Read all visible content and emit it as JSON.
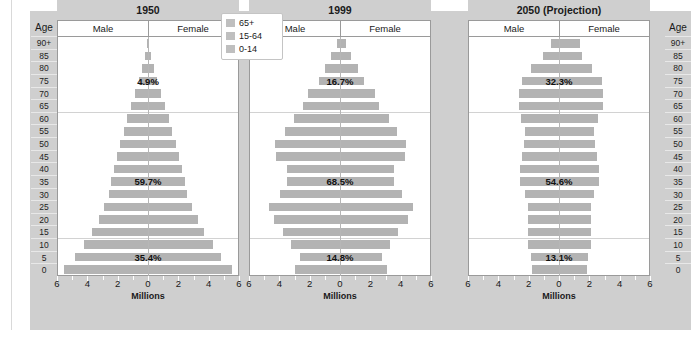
{
  "legend": {
    "items": [
      {
        "label": "65+",
        "swatch": "legend-swatch-65plus",
        "color": "#bfbfbf"
      },
      {
        "label": "15-64",
        "swatch": "legend-swatch-15to64",
        "color": "#bfbfbf"
      },
      {
        "label": "0-14",
        "swatch": "legend-swatch-0to14",
        "color": "#bfbfbf"
      }
    ]
  },
  "axis": {
    "age_header": "Age",
    "age_labels": [
      "90+",
      "85",
      "80",
      "75",
      "70",
      "65",
      "60",
      "55",
      "50",
      "45",
      "40",
      "35",
      "30",
      "25",
      "20",
      "15",
      "10",
      "5",
      "0"
    ],
    "x_title": "Millions",
    "x_ticks": [
      "6",
      "4",
      "2",
      "0",
      "2",
      "4",
      "6"
    ],
    "x_min": -6,
    "x_max": 6,
    "male_label": "Male",
    "female_label": "Female"
  },
  "caption": "",
  "chart_data": {
    "type": "bar",
    "title": "",
    "subtitle": "",
    "xlabel": "Millions",
    "ylabel": "Age",
    "xlim": [
      -6,
      6
    ],
    "grid": true,
    "legend_position": "top-center",
    "age_groups": [
      "90+",
      "85",
      "80",
      "75",
      "70",
      "65",
      "60",
      "55",
      "50",
      "45",
      "40",
      "35",
      "30",
      "25",
      "20",
      "15",
      "10",
      "5",
      "0"
    ],
    "panels": [
      {
        "title": "1950",
        "annotations": [
          {
            "text": "4.9%",
            "group": "65+",
            "age_index": 3
          },
          {
            "text": "59.7%",
            "group": "15-64",
            "age_index": 11
          },
          {
            "text": "35.4%",
            "group": "0-14",
            "age_index": 17
          }
        ],
        "shares": {
          "65+": 4.9,
          "15-64": 59.7,
          "0-14": 35.4
        },
        "male": [
          0.05,
          0.22,
          0.4,
          0.62,
          0.88,
          1.12,
          1.38,
          1.62,
          1.85,
          2.05,
          2.25,
          2.45,
          2.62,
          2.92,
          3.3,
          3.75,
          4.3,
          4.85,
          5.6
        ],
        "female": [
          0.05,
          0.22,
          0.4,
          0.62,
          0.88,
          1.12,
          1.38,
          1.62,
          1.85,
          2.05,
          2.25,
          2.45,
          2.62,
          2.92,
          3.3,
          3.75,
          4.3,
          4.85,
          5.6
        ]
      },
      {
        "title": "1999",
        "annotations": [
          {
            "text": "16.7%",
            "group": "65+",
            "age_index": 3
          },
          {
            "text": "68.5%",
            "group": "15-64",
            "age_index": 11
          },
          {
            "text": "14.8%",
            "group": "0-14",
            "age_index": 17
          }
        ],
        "shares": {
          "65+": 16.7,
          "15-64": 68.5,
          "0-14": 14.8
        },
        "male": [
          0.22,
          0.6,
          1.02,
          1.42,
          2.12,
          2.5,
          3.1,
          3.7,
          4.35,
          4.25,
          3.55,
          3.55,
          4.0,
          4.75,
          4.4,
          3.8,
          3.3,
          2.7,
          3.0
        ],
        "female": [
          0.42,
          0.72,
          1.18,
          1.62,
          2.3,
          2.62,
          3.25,
          3.8,
          4.4,
          4.3,
          3.6,
          3.6,
          4.1,
          4.85,
          4.5,
          3.85,
          3.35,
          2.8,
          3.1
        ]
      },
      {
        "title": "2050 (Projection)",
        "annotations": [
          {
            "text": "32.3%",
            "group": "65+",
            "age_index": 3
          },
          {
            "text": "54.6%",
            "group": "15-64",
            "age_index": 11
          },
          {
            "text": "13.1%",
            "group": "0-14",
            "age_index": 17
          }
        ],
        "shares": {
          "65+": 32.3,
          "15-64": 54.6,
          "0-14": 13.1
        },
        "male": [
          0.55,
          1.05,
          1.85,
          2.5,
          2.7,
          2.7,
          2.55,
          2.3,
          2.35,
          2.5,
          2.6,
          2.6,
          2.25,
          2.1,
          2.1,
          2.1,
          2.1,
          1.9,
          1.8
        ],
        "female": [
          1.4,
          1.5,
          2.2,
          2.85,
          2.95,
          2.9,
          2.6,
          2.35,
          2.4,
          2.55,
          2.65,
          2.65,
          2.3,
          2.15,
          2.15,
          2.15,
          2.15,
          1.95,
          1.85
        ]
      }
    ]
  }
}
